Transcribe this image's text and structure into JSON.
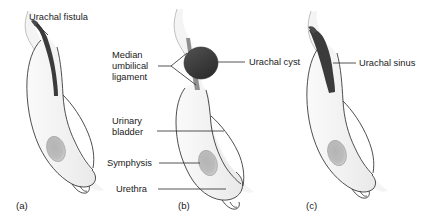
{
  "figure": {
    "background_color": "#ffffff",
    "line_color": "#3a3a3a",
    "tissue_fill": "#f2f2f2",
    "tissue_fill_light": "#f7f7f7",
    "lesion_color": "#3b3b3b",
    "lesion_color_dark": "#333333",
    "symphysis_color": "#b0b0b0"
  },
  "panels": [
    {
      "id": "a",
      "caption": "(a)",
      "labels": [
        {
          "id": "urachal-fistula",
          "text": "Urachal fistula"
        }
      ]
    },
    {
      "id": "b",
      "caption": "(b)",
      "labels": [
        {
          "id": "median-umbilical-ligament",
          "line1": "Median",
          "line2": "umbilical",
          "line3": "ligament"
        },
        {
          "id": "urachal-cyst",
          "text": "Urachal cyst"
        },
        {
          "id": "urinary-bladder",
          "line1": "Urinary",
          "line2": "bladder"
        },
        {
          "id": "symphysis",
          "text": "Symphysis"
        },
        {
          "id": "urethra",
          "text": "Urethra"
        }
      ]
    },
    {
      "id": "c",
      "caption": "(c)",
      "labels": [
        {
          "id": "urachal-sinus",
          "text": "Urachal sinus"
        }
      ]
    }
  ]
}
